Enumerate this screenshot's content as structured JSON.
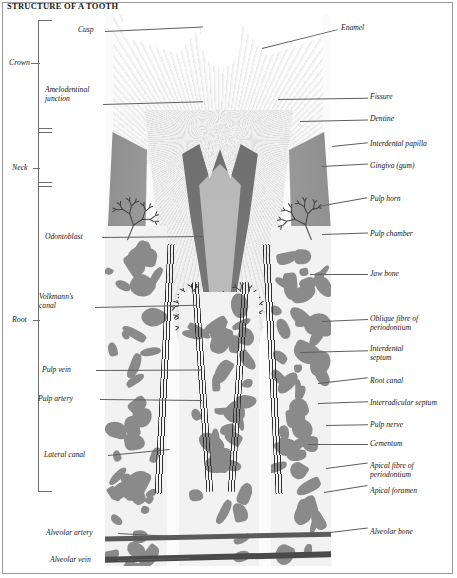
{
  "title": "STRUCTURE OF A TOOTH",
  "colors": {
    "frame": "#9a9a9a",
    "text": "#161616",
    "leader": "#5f5f5f",
    "enamel": "#fafafa",
    "dentine": "#efefef",
    "pulp": "#6f6f6f",
    "gingiva": "#8d8d8d",
    "bone_trabecula": "#8a8a8a",
    "bone_marrow": "#f2f2f2",
    "fibre": "#2e2e2e"
  },
  "bracket": {
    "segments": [
      {
        "label": "Crown",
        "top": 58
      },
      {
        "label": "Neck",
        "top": 163
      },
      {
        "label": "Root",
        "top": 315
      }
    ]
  },
  "labels_left": [
    {
      "text": "Cusp",
      "x": 78,
      "y": 26,
      "lead_x": 105,
      "lead_y": 31,
      "lead_w": 98,
      "lead_rot": -2.6
    },
    {
      "text": "Amelodentinal",
      "x": 45,
      "y": 86,
      "lead_x": 103,
      "lead_y": 104,
      "lead_w": 100,
      "lead_rot": -1.6
    },
    {
      "text": "junction",
      "x": 45,
      "y": 95
    },
    {
      "text": "Odontoblast",
      "x": 45,
      "y": 233,
      "lead_x": 102,
      "lead_y": 237,
      "lead_w": 100,
      "lead_rot": -0.6
    },
    {
      "text": "Volkmann's",
      "x": 39,
      "y": 293,
      "lead_x": 95,
      "lead_y": 307,
      "lead_w": 102,
      "lead_rot": -1.2
    },
    {
      "text": "canal",
      "x": 39,
      "y": 302
    },
    {
      "text": "Pulp vein",
      "x": 42,
      "y": 366,
      "lead_x": 96,
      "lead_y": 370,
      "lead_w": 105,
      "lead_rot": -0.3
    },
    {
      "text": "Pulp artery",
      "x": 38,
      "y": 395,
      "lead_x": 100,
      "lead_y": 399,
      "lead_w": 102,
      "lead_rot": 0.6
    },
    {
      "text": "Lateral canal",
      "x": 44,
      "y": 451,
      "lead_x": 108,
      "lead_y": 455,
      "lead_w": 62,
      "lead_rot": -5.5
    },
    {
      "text": "Alveolar artery",
      "x": 46,
      "y": 529,
      "lead_x": 118,
      "lead_y": 533,
      "lead_w": 78,
      "lead_rot": 3.2
    },
    {
      "text": "Alveolar vein",
      "x": 50,
      "y": 556,
      "lead_x": 118,
      "lead_y": 560,
      "lead_w": 72,
      "lead_rot": -1.8
    }
  ],
  "labels_right": [
    {
      "text": "Enamel",
      "x": 341,
      "y": 24,
      "lead_x": 262,
      "lead_y": 48,
      "lead_w": 78,
      "lead_rot": -14.0
    },
    {
      "text": "Fissure",
      "x": 370,
      "y": 93,
      "lead_x": 278,
      "lead_y": 99,
      "lead_w": 90,
      "lead_rot": -0.8
    },
    {
      "text": "Dentine",
      "x": 370,
      "y": 115,
      "lead_x": 300,
      "lead_y": 121,
      "lead_w": 68,
      "lead_rot": -1.2
    },
    {
      "text": "Interdental papilla",
      "x": 370,
      "y": 140,
      "lead_x": 332,
      "lead_y": 146,
      "lead_w": 36,
      "lead_rot": -6.0
    },
    {
      "text": "Gingiva (gum)",
      "x": 370,
      "y": 162,
      "lead_x": 322,
      "lead_y": 166,
      "lead_w": 46,
      "lead_rot": -3.0
    },
    {
      "text": "Pulp horn",
      "x": 370,
      "y": 195,
      "lead_x": 318,
      "lead_y": 206,
      "lead_w": 50,
      "lead_rot": -10.0
    },
    {
      "text": "Pulp chamber",
      "x": 370,
      "y": 230,
      "lead_x": 322,
      "lead_y": 234,
      "lead_w": 46,
      "lead_rot": -2.0
    },
    {
      "text": "Jaw bone",
      "x": 370,
      "y": 270,
      "lead_x": 310,
      "lead_y": 274,
      "lead_w": 58,
      "lead_rot": 0.0
    },
    {
      "text": "Oblique fibre of",
      "x": 370,
      "y": 315,
      "lead_x": 322,
      "lead_y": 321,
      "lead_w": 46,
      "lead_rot": -2.5
    },
    {
      "text": "periodontium",
      "x": 370,
      "y": 324
    },
    {
      "text": "Interdental",
      "x": 370,
      "y": 345,
      "lead_x": 300,
      "lead_y": 352,
      "lead_w": 68,
      "lead_rot": -1.5
    },
    {
      "text": "septum",
      "x": 370,
      "y": 354
    },
    {
      "text": "Root canal",
      "x": 370,
      "y": 377,
      "lead_x": 318,
      "lead_y": 383,
      "lead_w": 50,
      "lead_rot": -6.5
    },
    {
      "text": "Interradicular septum",
      "x": 370,
      "y": 399,
      "lead_x": 318,
      "lead_y": 403,
      "lead_w": 50,
      "lead_rot": -2.0
    },
    {
      "text": "Pulp nerve",
      "x": 370,
      "y": 421,
      "lead_x": 326,
      "lead_y": 425,
      "lead_w": 42,
      "lead_rot": -1.0
    },
    {
      "text": "Cementum",
      "x": 370,
      "y": 440,
      "lead_x": 308,
      "lead_y": 444,
      "lead_w": 60,
      "lead_rot": 0.0
    },
    {
      "text": "Apical fibre of",
      "x": 370,
      "y": 462,
      "lead_x": 326,
      "lead_y": 468,
      "lead_w": 42,
      "lead_rot": -7.5
    },
    {
      "text": "periodontium",
      "x": 370,
      "y": 471
    },
    {
      "text": "Apical foramen",
      "x": 370,
      "y": 487,
      "lead_x": 324,
      "lead_y": 492,
      "lead_w": 44,
      "lead_rot": -9.0
    },
    {
      "text": "Alveolar bone",
      "x": 370,
      "y": 528,
      "lead_x": 322,
      "lead_y": 533,
      "lead_w": 46,
      "lead_rot": -7.0
    }
  ]
}
